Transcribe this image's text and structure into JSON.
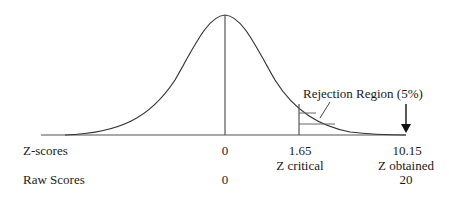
{
  "diagram": {
    "type": "normal-distribution-hypothesis-test",
    "rejection_label": "Rejection Region (5%)",
    "rows": {
      "z_label": "Z-scores",
      "raw_label": "Raw Scores"
    },
    "points": {
      "mean": {
        "z": "0",
        "raw": "0"
      },
      "critical": {
        "z": "1.65",
        "caption": "Z critical"
      },
      "obtained": {
        "z": "10.15",
        "caption": "Z obtained",
        "raw": "20"
      }
    },
    "colors": {
      "curve": "#333333",
      "text": "#1a1a1a"
    }
  }
}
